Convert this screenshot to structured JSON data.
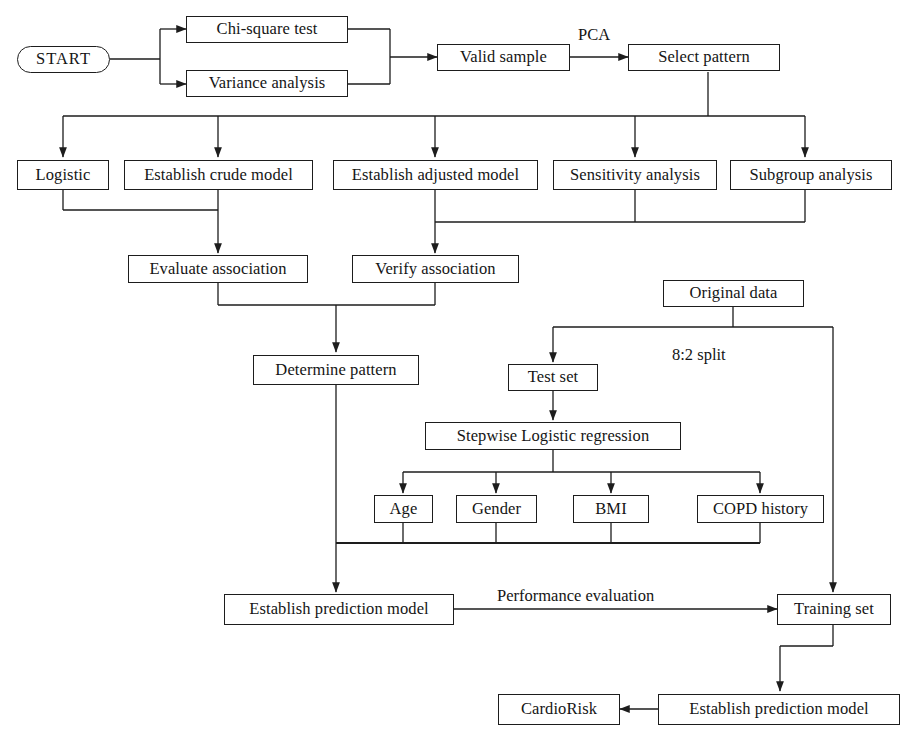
{
  "diagram": {
    "stroke_color": "#1d1d1d",
    "text_color": "#151515",
    "background_color": "#ffffff"
  },
  "nodes": {
    "start": "START",
    "chi_square_test": "Chi-square test",
    "variance_analysis": "Variance analysis",
    "valid_sample": "Valid sample",
    "select_pattern": "Select pattern",
    "logistic": "Logistic",
    "establish_crude_model": "Establish crude model",
    "establish_adjusted_model": "Establish adjusted model",
    "sensitivity_analysis": "Sensitivity analysis",
    "subgroup_analysis": "Subgroup analysis",
    "evaluate_association": "Evaluate association",
    "verify_association": "Verify association",
    "determine_pattern": "Determine pattern",
    "original_data": "Original data",
    "test_set": "Test set",
    "stepwise_logistic_regression": "Stepwise Logistic regression",
    "age": "Age",
    "gender": "Gender",
    "bmi": "BMI",
    "copd_history": "COPD history",
    "establish_prediction_model_left": "Establish prediction model",
    "training_set": "Training set",
    "establish_prediction_model_bottom": "Establish prediction model",
    "cardiorisk": "CardioRisk"
  },
  "edge_labels": {
    "pca": "PCA",
    "split_ratio": "8:2 split",
    "performance_evaluation": "Performance evaluation"
  }
}
